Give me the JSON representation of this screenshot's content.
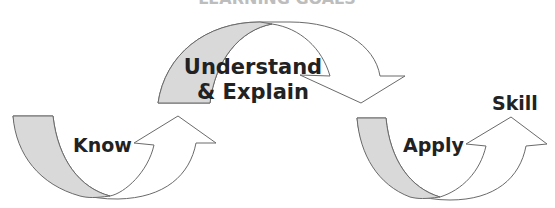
{
  "diagram": {
    "title_partial": "LEARNING GOALS",
    "colors": {
      "band_fill": "#d9d9d9",
      "stroke": "#6a6a6a",
      "text": "#222222",
      "background": "#ffffff"
    },
    "stages": [
      {
        "id": "know",
        "label": "Know"
      },
      {
        "id": "understand",
        "label_line1": "Understand",
        "label_line2": "& Explain"
      },
      {
        "id": "apply",
        "label": "Apply"
      }
    ],
    "outcome": {
      "label": "Skill"
    }
  }
}
